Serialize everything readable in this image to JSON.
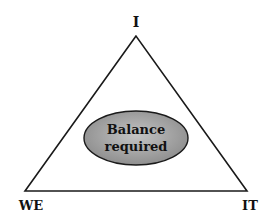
{
  "diagram": {
    "vertices": {
      "top": "I",
      "bottom_left": "WE",
      "bottom_right": "IT"
    },
    "center": {
      "line1": "Balance",
      "line2": "required"
    },
    "colors": {
      "ellipse_fill": "#9a9a9a",
      "stroke": "#1a1a1a",
      "background": "#ffffff"
    }
  }
}
